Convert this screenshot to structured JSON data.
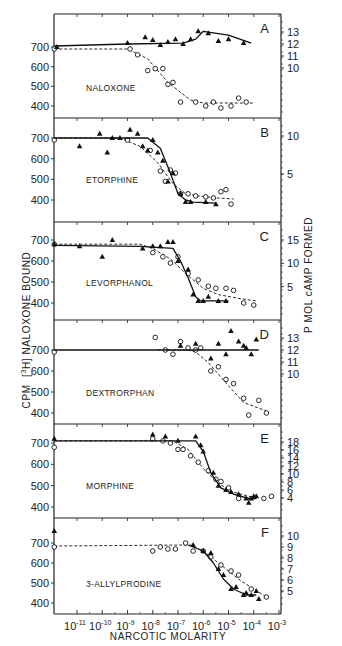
{
  "figure": {
    "xlabel": "NARCOTIC MOLARITY",
    "ylabel_left": "CPM [3H]NALOXONE BOUND",
    "ylabel_left_parts": {
      "pre": "CPM",
      "iso": "3",
      "elem": "H",
      "post": "NALOXONE  BOUND"
    },
    "ylabel_right": "P MOL cAMP FORMED",
    "x_ticks": [
      "10-11",
      "10-10",
      "10-9",
      "10-8",
      "10-7",
      "10-6",
      "10-5",
      "10-4",
      "10-3"
    ],
    "x_tick_exps": [
      -11,
      -10,
      -9,
      -8,
      -7,
      -6,
      -5,
      -4,
      -3
    ],
    "left_ticks": [
      700,
      600,
      500,
      400
    ]
  },
  "chart_data": [
    {
      "type": "line",
      "panel": "A",
      "title": "NALOXONE",
      "xlabel": "NARCOTIC MOLARITY",
      "ylabel": "CPM [3H]NALOXONE BOUND",
      "xscale": "log",
      "right_axis_ticks": [
        "13",
        "12",
        "11",
        "10"
      ],
      "series": [
        {
          "name": "[3H]naloxone bound (open circles, dashed)",
          "marker": "circle-open",
          "x": [
            -11.9,
            -8.9,
            -8.6,
            -8.2,
            -7.9,
            -7.6,
            -7.4,
            -7.2,
            -6.9,
            -6.3,
            -5.9,
            -5.6,
            -5.3,
            -4.9,
            -4.6,
            -4.3
          ],
          "y": [
            690,
            690,
            660,
            580,
            590,
            590,
            510,
            520,
            420,
            420,
            400,
            420,
            390,
            400,
            440,
            420
          ],
          "fit": {
            "x": [
              -11.9,
              -9.0,
              -8.2,
              -7.4,
              -6.5,
              -6.0,
              -4.0
            ],
            "y": [
              690,
              690,
              640,
              520,
              430,
              415,
              415
            ]
          }
        },
        {
          "name": "cAMP formed (filled triangles, solid)",
          "marker": "triangle-filled",
          "x": [
            -11.8,
            -9.0,
            -8.3,
            -8.0,
            -7.7,
            -7.4,
            -7.1,
            -6.8,
            -6.5,
            -6.2,
            -5.8,
            -5.4,
            -5.0,
            -4.4
          ],
          "y": [
            700,
            720,
            750,
            735,
            710,
            725,
            740,
            715,
            740,
            780,
            770,
            730,
            740,
            720
          ],
          "fit": {
            "x": [
              -11.9,
              -9.0,
              -6.8,
              -6.3,
              -6.0,
              -5.0,
              -4.1
            ],
            "y": [
              705,
              715,
              720,
              740,
              780,
              760,
              720
            ]
          }
        }
      ]
    },
    {
      "type": "line",
      "panel": "B",
      "title": "ETORPHINE",
      "xscale": "log",
      "right_axis_ticks": [
        "10",
        "5"
      ],
      "series": [
        {
          "name": "[3H]naloxone bound (open circles, dashed)",
          "marker": "circle-open",
          "x": [
            -11.9,
            -9.0,
            -8.1,
            -7.7,
            -7.5,
            -7.3,
            -7.1,
            -6.9,
            -6.6,
            -6.3,
            -5.9,
            -5.6,
            -5.3,
            -5.1,
            -4.9
          ],
          "y": [
            690,
            690,
            640,
            540,
            490,
            545,
            530,
            430,
            430,
            420,
            415,
            410,
            440,
            450,
            380
          ],
          "fit": {
            "x": [
              -11.9,
              -9.3,
              -8.5,
              -7.8,
              -7.2,
              -6.7,
              -6.2,
              -5.5,
              -4.8
            ],
            "y": [
              700,
              700,
              660,
              580,
              480,
              430,
              420,
              410,
              405
            ]
          }
        },
        {
          "name": "cAMP formed (filled triangles, solid)",
          "marker": "triangle-filled",
          "x": [
            -10.9,
            -10.1,
            -9.8,
            -9.6,
            -9.3,
            -8.9,
            -8.6,
            -8.4,
            -8.2,
            -8.0,
            -7.8,
            -7.6,
            -7.4,
            -7.2,
            -6.9,
            -6.7,
            -6.5,
            -5.9,
            -5.5
          ],
          "y": [
            660,
            720,
            630,
            700,
            700,
            740,
            720,
            660,
            640,
            690,
            630,
            590,
            490,
            530,
            430,
            390,
            390,
            390,
            380
          ],
          "fit": {
            "x": [
              -11.9,
              -8.2,
              -7.7,
              -7.3,
              -7.0,
              -6.7,
              -6.4,
              -5.5
            ],
            "y": [
              700,
              700,
              650,
              530,
              430,
              400,
              390,
              385
            ]
          }
        }
      ]
    },
    {
      "type": "line",
      "panel": "C",
      "title": "LEVORPHANOL",
      "xscale": "log",
      "right_axis_ticks": [
        "15",
        "10",
        "5"
      ],
      "series": [
        {
          "name": "[3H]naloxone bound (open circles, dashed)",
          "marker": "circle-open",
          "x": [
            -11.9,
            -8.0,
            -7.6,
            -7.3,
            -7.0,
            -6.6,
            -6.2,
            -5.8,
            -5.5,
            -5.1,
            -4.8,
            -4.4,
            -4.0
          ],
          "y": [
            680,
            640,
            620,
            590,
            620,
            540,
            510,
            480,
            470,
            470,
            460,
            400,
            390
          ],
          "fit": {
            "x": [
              -11.9,
              -8.5,
              -8.0,
              -7.3,
              -6.6,
              -6.0,
              -5.4,
              -4.5,
              -3.9
            ],
            "y": [
              680,
              680,
              660,
              610,
              530,
              470,
              440,
              420,
              410
            ]
          }
        },
        {
          "name": "cAMP formed (filled triangles, solid)",
          "marker": "triangle-filled",
          "x": [
            -11.9,
            -10.9,
            -10.0,
            -9.6,
            -8.4,
            -8.0,
            -7.7,
            -7.4,
            -7.2,
            -7.0,
            -6.6,
            -6.4,
            -6.2,
            -6.0,
            -5.8,
            -5.4,
            -5.1
          ],
          "y": [
            680,
            670,
            620,
            700,
            660,
            670,
            670,
            690,
            690,
            600,
            560,
            440,
            410,
            410,
            430,
            410,
            410
          ],
          "fit": {
            "x": [
              -11.9,
              -8.5,
              -7.2,
              -6.9,
              -6.6,
              -6.3,
              -6.1,
              -5.0
            ],
            "y": [
              675,
              670,
              660,
              600,
              520,
              430,
              410,
              410
            ]
          }
        }
      ]
    },
    {
      "type": "line",
      "panel": "D",
      "title": "DEXTRORPHAN",
      "xscale": "log",
      "right_axis_ticks": [
        "13",
        "12",
        "11",
        "10"
      ],
      "series": [
        {
          "name": "[3H]naloxone bound (open circles, dashed)",
          "marker": "circle-open",
          "x": [
            -11.9,
            -7.9,
            -7.5,
            -7.2,
            -6.9,
            -6.6,
            -6.3,
            -6.1,
            -5.7,
            -5.4,
            -5.1,
            -4.8,
            -4.4,
            -4.2,
            -3.8,
            -3.5
          ],
          "y": [
            690,
            760,
            700,
            680,
            740,
            710,
            700,
            710,
            600,
            620,
            560,
            540,
            470,
            390,
            460,
            400
          ],
          "fit": {
            "x": [
              -7.8,
              -6.6,
              -6.3,
              -5.8,
              -5.0,
              -4.4,
              -3.5
            ],
            "y": [
              700,
              700,
              690,
              640,
              530,
              450,
              410
            ]
          }
        },
        {
          "name": "cAMP formed (filled triangles, solid)",
          "marker": "triangle-filled",
          "x": [
            -6.9,
            -6.3,
            -5.7,
            -5.4,
            -5.1,
            -4.9,
            -4.6,
            -4.4,
            -4.3,
            -4.1,
            -3.9
          ],
          "y": [
            720,
            730,
            660,
            730,
            680,
            790,
            740,
            720,
            710,
            680,
            750
          ],
          "fit": {
            "x": [
              -11.9,
              -3.8
            ],
            "y": [
              700,
              700
            ]
          }
        }
      ]
    },
    {
      "type": "line",
      "panel": "E",
      "title": "MORPHINE",
      "xscale": "log",
      "right_axis_ticks": [
        "18",
        "16",
        "14",
        "12",
        "10",
        "8",
        "6",
        "4"
      ],
      "series": [
        {
          "name": "[3H]naloxone bound (open circles, dashed)",
          "marker": "circle-open",
          "x": [
            -11.9,
            -8.0,
            -7.6,
            -7.3,
            -7.0,
            -6.8,
            -6.5,
            -6.2,
            -5.8,
            -5.5,
            -5.3,
            -5.0,
            -4.6,
            -3.6,
            -3.3
          ],
          "y": [
            680,
            720,
            710,
            700,
            670,
            670,
            640,
            610,
            570,
            530,
            520,
            490,
            440,
            440,
            450
          ],
          "fit": {
            "x": [
              -11.9,
              -7.2,
              -6.6,
              -6.0,
              -5.4,
              -4.8,
              -4.2,
              -3.9
            ],
            "y": [
              710,
              710,
              670,
              580,
              510,
              470,
              450,
              445
            ]
          }
        },
        {
          "name": "cAMP formed (filled triangles, solid)",
          "marker": "triangle-filled",
          "x": [
            -11.9,
            -8.0,
            -7.5,
            -7.0,
            -6.3,
            -6.1,
            -6.0,
            -5.6,
            -5.4,
            -5.1,
            -4.9,
            -4.6,
            -4.3,
            -4.2,
            -4.1,
            -4.0,
            -3.9
          ],
          "y": [
            720,
            740,
            730,
            710,
            730,
            690,
            660,
            560,
            500,
            480,
            470,
            460,
            440,
            420,
            440,
            450,
            450
          ],
          "fit": {
            "x": [
              -11.9,
              -6.3,
              -6.0,
              -5.7,
              -5.3,
              -4.8,
              -4.2,
              -3.9
            ],
            "y": [
              710,
              710,
              660,
              560,
              490,
              460,
              440,
              440
            ]
          }
        }
      ]
    },
    {
      "type": "line",
      "panel": "F",
      "title": "3-ALLYLPRODINE",
      "xscale": "log",
      "right_axis_ticks": [
        "10",
        "9",
        "8",
        "7",
        "6",
        "5"
      ],
      "series": [
        {
          "name": "[3H]naloxone bound (open circles, dashed)",
          "marker": "circle-open",
          "x": [
            -11.9,
            -8.0,
            -7.7,
            -7.4,
            -7.1,
            -6.7,
            -6.4,
            -6.0,
            -5.7,
            -5.3,
            -4.9,
            -4.6,
            -4.1,
            -3.5
          ],
          "y": [
            680,
            660,
            680,
            670,
            670,
            700,
            660,
            660,
            630,
            590,
            560,
            540,
            470,
            430
          ],
          "fit": {
            "x": [
              -11.9,
              -6.5,
              -6.0,
              -5.5,
              -5.0,
              -4.5,
              -4.0,
              -3.5
            ],
            "y": [
              685,
              690,
              660,
              610,
              560,
              510,
              470,
              430
            ]
          }
        },
        {
          "name": "cAMP formed (filled triangles, solid)",
          "marker": "triangle-filled",
          "x": [
            -11.9,
            -6.4,
            -6.0,
            -5.7,
            -5.4,
            -5.2,
            -4.9,
            -4.7,
            -4.4,
            -4.3,
            -4.1,
            -3.9,
            -3.8
          ],
          "y": [
            760,
            690,
            660,
            650,
            570,
            540,
            470,
            480,
            440,
            450,
            440,
            460,
            420
          ],
          "fit": {
            "x": [
              -6.6,
              -6.0,
              -5.6,
              -5.2,
              -4.8,
              -4.3,
              -3.9
            ],
            "y": [
              690,
              660,
              600,
              520,
              470,
              440,
              440
            ]
          }
        }
      ]
    }
  ]
}
